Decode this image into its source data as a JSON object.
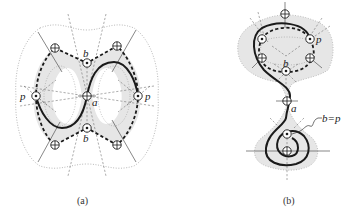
{
  "figure": {
    "panels": [
      {
        "id": "a",
        "caption": "(a)",
        "labels": {
          "b_top": "b",
          "b_bottom": "b",
          "p_left": "p",
          "p_right": "p",
          "a": "a"
        }
      },
      {
        "id": "b",
        "caption": "(b)",
        "labels": {
          "p": "p",
          "b": "b",
          "a": "a",
          "bp": "b=p"
        }
      }
    ]
  },
  "colors": {
    "shade": "#e6e6e6",
    "stroke": "#1a1a1a",
    "thin": "#555555",
    "dotted": "#999999",
    "background": "#ffffff"
  },
  "legend_symbols": {
    "target_node": "circle-plus",
    "source_node": "circle-dot"
  }
}
